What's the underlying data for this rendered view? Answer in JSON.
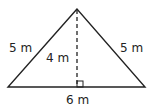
{
  "figure": {
    "shape": "isosceles-triangle",
    "colors": {
      "stroke": "#222222",
      "background": "#ffffff"
    },
    "labels": {
      "left_side": "5 m",
      "right_side": "5 m",
      "height": "4 m",
      "base": "6 m"
    },
    "markers": {
      "height_line": "dashed",
      "right_angle": "square"
    }
  }
}
